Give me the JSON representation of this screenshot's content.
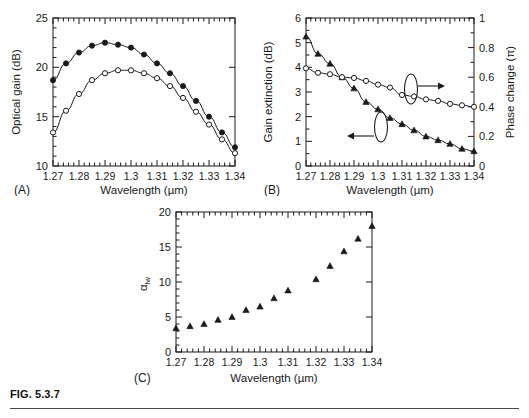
{
  "figure": {
    "number": "FIG. 5.3.7",
    "panel_labels": {
      "a": "(A)",
      "b": "(B)",
      "c": "(C)"
    }
  },
  "axis_titles": {
    "wavelength": "Wavelength (µm)",
    "optical_gain": "Optical gain (dB)",
    "gain_extinction": "Gain extinction (dB)",
    "phase_change": "Phase change (π)",
    "alpha_lw_base": "α",
    "alpha_lw_sub": "lw"
  },
  "colors": {
    "axis": "#1a1a1a",
    "curve": "#1a1a1a",
    "marker_fill_solid": "#1a1a1a",
    "marker_fill_open": "#ffffff",
    "rule": "#4a4a4a",
    "background": "#ffffff"
  },
  "chart_data": [
    {
      "id": "panel-a",
      "type": "line",
      "title": "",
      "panel_label": "(A)",
      "xlabel": "Wavelength (µm)",
      "ylabel": "Optical gain (dB)",
      "xlim": [
        1.27,
        1.34
      ],
      "ylim": [
        10,
        25
      ],
      "xticks": [
        1.27,
        1.28,
        1.29,
        1.3,
        1.31,
        1.32,
        1.33,
        1.34
      ],
      "xticklabels": [
        "1.27",
        "1.28",
        "1.29",
        "1.3",
        "1.31",
        "1.32",
        "1.33",
        "1.34"
      ],
      "yticks": [
        10,
        15,
        20,
        25
      ],
      "yticklabels": [
        "10",
        "15",
        "20",
        "25"
      ],
      "minor_ticks": true,
      "grid": false,
      "legend": "none",
      "x": [
        1.27,
        1.275,
        1.28,
        1.285,
        1.29,
        1.295,
        1.3,
        1.305,
        1.31,
        1.315,
        1.32,
        1.325,
        1.33,
        1.335,
        1.34
      ],
      "series": [
        {
          "name": "solid-circle-series",
          "marker": "filled-circle",
          "values": [
            18.7,
            20.4,
            21.5,
            22.2,
            22.5,
            22.3,
            22.0,
            21.3,
            20.4,
            19.4,
            18.1,
            16.6,
            15.0,
            13.4,
            11.9
          ]
        },
        {
          "name": "open-circle-series",
          "marker": "open-circle",
          "values": [
            13.4,
            15.6,
            17.3,
            18.7,
            19.4,
            19.7,
            19.7,
            19.4,
            18.9,
            18.1,
            16.9,
            15.5,
            14.2,
            12.7,
            11.3
          ]
        }
      ]
    },
    {
      "id": "panel-b",
      "type": "line",
      "title": "",
      "panel_label": "(B)",
      "xlabel": "Wavelength (µm)",
      "ylabel": "Gain extinction (dB)",
      "y2label": "Phase change (π)",
      "xlim": [
        1.27,
        1.34
      ],
      "ylim": [
        0,
        6
      ],
      "y2lim": [
        0,
        1
      ],
      "xticks": [
        1.27,
        1.28,
        1.29,
        1.3,
        1.31,
        1.32,
        1.33,
        1.34
      ],
      "xticklabels": [
        "1.27",
        "1.28",
        "1.29",
        "1.3",
        "1.31",
        "1.32",
        "1.33",
        "1.34"
      ],
      "yticks": [
        0,
        1,
        2,
        3,
        4,
        5,
        6
      ],
      "yticklabels": [
        "0",
        "1",
        "2",
        "3",
        "4",
        "5",
        "6"
      ],
      "y2ticks": [
        0,
        0.2,
        0.4,
        0.6,
        0.8,
        1
      ],
      "y2ticklabels": [
        "0",
        "0.2",
        "0.4",
        "0.6",
        "0.8",
        "1"
      ],
      "minor_ticks": true,
      "grid": false,
      "annotations": [
        {
          "name": "phase-axis-pointer",
          "shape": "ellipse-with-arrow",
          "direction": "right",
          "target_axis": "right"
        },
        {
          "name": "gain-axis-pointer",
          "shape": "ellipse-with-arrow",
          "direction": "left",
          "target_axis": "left"
        }
      ],
      "x": [
        1.27,
        1.275,
        1.28,
        1.285,
        1.29,
        1.295,
        1.3,
        1.305,
        1.31,
        1.315,
        1.32,
        1.325,
        1.33,
        1.335,
        1.34
      ],
      "series": [
        {
          "name": "gain-extinction-series",
          "marker": "filled-triangle",
          "axis": "left",
          "values": [
            5.25,
            4.55,
            4.15,
            3.6,
            3.15,
            2.6,
            2.3,
            1.95,
            1.7,
            1.45,
            1.2,
            1.05,
            0.9,
            0.7,
            0.6
          ]
        },
        {
          "name": "phase-change-series",
          "marker": "open-circle",
          "axis": "right",
          "values": [
            0.66,
            0.63,
            0.62,
            0.6,
            0.595,
            0.575,
            0.55,
            0.53,
            0.48,
            0.47,
            0.45,
            0.44,
            0.42,
            0.41,
            0.4
          ]
        }
      ]
    },
    {
      "id": "panel-c",
      "type": "scatter",
      "title": "",
      "panel_label": "(C)",
      "xlabel": "Wavelength (µm)",
      "ylabel": "αlw",
      "xlim": [
        1.27,
        1.34
      ],
      "ylim": [
        0,
        20
      ],
      "xticks": [
        1.27,
        1.28,
        1.29,
        1.3,
        1.31,
        1.32,
        1.33,
        1.34
      ],
      "xticklabels": [
        "1.27",
        "1.28",
        "1.29",
        "1.3",
        "1.31",
        "1.32",
        "1.33",
        "1.34"
      ],
      "yticks": [
        0,
        5,
        10,
        15,
        20
      ],
      "yticklabels": [
        "0",
        "5",
        "10",
        "15",
        "20"
      ],
      "minor_ticks": true,
      "grid": false,
      "legend": "none",
      "x": [
        1.27,
        1.275,
        1.28,
        1.285,
        1.29,
        1.295,
        1.3,
        1.305,
        1.31,
        1.32,
        1.325,
        1.33,
        1.335,
        1.34
      ],
      "series": [
        {
          "name": "alpha-lw-series",
          "marker": "filled-triangle",
          "values": [
            3.4,
            3.7,
            4.0,
            4.6,
            5.0,
            6.0,
            6.5,
            7.7,
            8.8,
            10.4,
            12.3,
            14.4,
            16.2,
            18.0
          ]
        }
      ]
    }
  ]
}
